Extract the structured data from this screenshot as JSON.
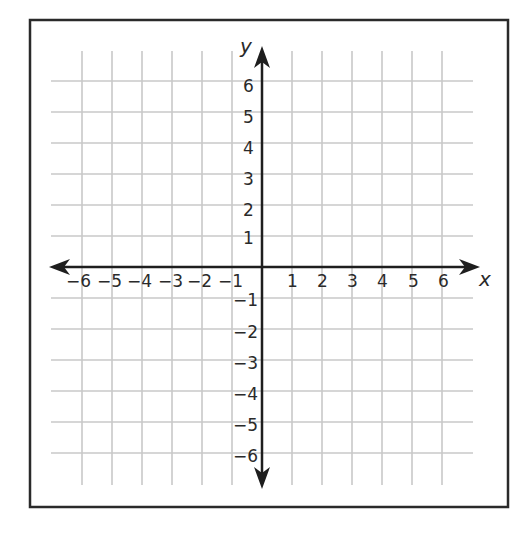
{
  "diagram": {
    "type": "coordinate-plane",
    "x_axis_label": "x",
    "y_axis_label": "y",
    "x_range": [
      -6,
      6
    ],
    "y_range": [
      -6,
      6
    ],
    "x_tick_labels": [
      "−6",
      "−5",
      "−4",
      "−3",
      "−2",
      "−1",
      "1",
      "2",
      "3",
      "4",
      "5",
      "6"
    ],
    "y_tick_labels": [
      "6",
      "5",
      "4",
      "3",
      "2",
      "1",
      "−1",
      "−2",
      "−3",
      "−4",
      "−5",
      "−6"
    ],
    "grid": true,
    "colors": {
      "border": "#2a2a2a",
      "axis": "#1e1e1e",
      "grid": "#c8c8c8",
      "background": "#ffffff"
    }
  }
}
